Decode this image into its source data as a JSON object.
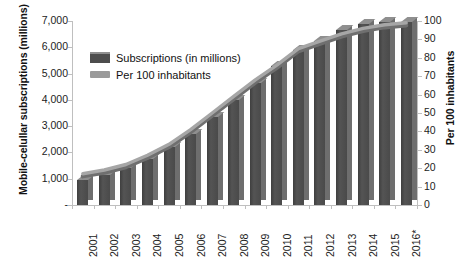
{
  "chart_data": {
    "type": "bar",
    "title": "",
    "subtitle": "",
    "xlabel": "",
    "ylabel": "Mobile-celullar subscriptions (millions)",
    "y2label": "Per 100 inhabitants",
    "grid": false,
    "legend_position": "upper-left-inside",
    "categories": [
      "2001",
      "2002",
      "2003",
      "2004",
      "2005",
      "2006",
      "2007",
      "2008",
      "2009",
      "2010",
      "2011",
      "2012",
      "2013",
      "2014",
      "2015",
      "2016*"
    ],
    "ylim": [
      0,
      7000
    ],
    "yticks": [
      "-",
      "1,000",
      "2,000",
      "3,000",
      "4,000",
      "5,000",
      "6,000",
      "7,000"
    ],
    "ytick_values": [
      0,
      1000,
      2000,
      3000,
      4000,
      5000,
      6000,
      7000
    ],
    "y2lim": [
      0,
      100
    ],
    "y2ticks": [
      "0",
      "10",
      "20",
      "30",
      "40",
      "50",
      "60",
      "70",
      "80",
      "90",
      "100"
    ],
    "y2tick_values": [
      0,
      10,
      20,
      30,
      40,
      50,
      60,
      70,
      80,
      90,
      100
    ],
    "series": [
      {
        "name": "Subscriptions (in millions)",
        "type": "bar",
        "axis": "left",
        "color": "#4d4d4d",
        "values": [
          960,
          1150,
          1400,
          1750,
          2200,
          2700,
          3350,
          4000,
          4650,
          5300,
          5900,
          6250,
          6650,
          6900,
          6950,
          6950
        ]
      },
      {
        "name": "Per 100 inhabitants",
        "type": "line",
        "axis": "right",
        "color": "#9a9a9a",
        "values": [
          17,
          19,
          22,
          27,
          33,
          41,
          50,
          59,
          68,
          76,
          85,
          89,
          93,
          96,
          98,
          99
        ]
      }
    ],
    "legend": [
      "Subscriptions (in millions)",
      "Per 100 inhabitants"
    ]
  },
  "axes": {
    "left_title": "Mobile-celullar subscriptions (millions)",
    "right_title": "Per 100 inhabitants"
  },
  "legend": {
    "bars_label": "Subscriptions (in millions)",
    "line_label": "Per 100 inhabitants"
  }
}
